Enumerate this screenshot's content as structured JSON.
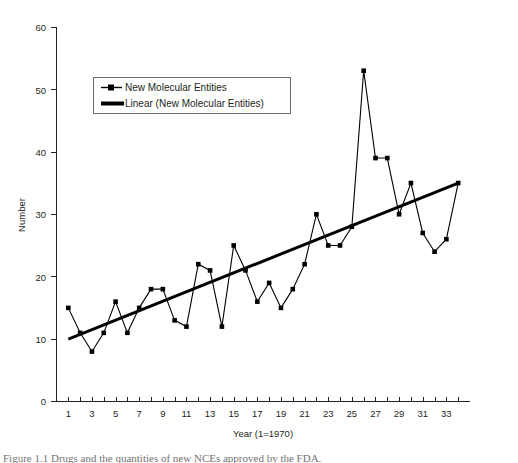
{
  "figure": {
    "caption_partial": "Figure 1.1  Drugs and the quantities of new NCEs approved by the FDA."
  },
  "legend": {
    "position": "top-left-inside",
    "entries": [
      {
        "label": "New Molecular Entities",
        "marker": "square-line",
        "color": "#000000"
      },
      {
        "label": "Linear (New Molecular Entities)",
        "marker": "thick-line",
        "color": "#000000"
      }
    ]
  },
  "chart_data": {
    "type": "line",
    "title": "",
    "xlabel": "Year (1=1970)",
    "ylabel": "Number",
    "xlim": [
      0,
      35
    ],
    "ylim": [
      0,
      60
    ],
    "yticks": [
      0,
      10,
      20,
      30,
      40,
      50,
      60
    ],
    "xticks": [
      1,
      2,
      3,
      4,
      5,
      6,
      7,
      8,
      9,
      10,
      11,
      12,
      13,
      14,
      15,
      16,
      17,
      18,
      19,
      20,
      21,
      22,
      23,
      24,
      25,
      26,
      27,
      28,
      29,
      30,
      31,
      32,
      33,
      34
    ],
    "xtick_labels_shown": [
      1,
      3,
      5,
      7,
      9,
      11,
      13,
      15,
      17,
      19,
      21,
      23,
      25,
      27,
      29,
      31,
      33
    ],
    "grid": false,
    "x": [
      1,
      2,
      3,
      4,
      5,
      6,
      7,
      8,
      9,
      10,
      11,
      12,
      13,
      14,
      15,
      16,
      17,
      18,
      19,
      20,
      21,
      22,
      23,
      24,
      25,
      26,
      27,
      28,
      29,
      30,
      31,
      32,
      33,
      34
    ],
    "series": [
      {
        "name": "New Molecular Entities",
        "values": [
          15,
          11,
          8,
          11,
          16,
          11,
          15,
          18,
          18,
          13,
          12,
          22,
          21,
          12,
          25,
          21,
          16,
          19,
          15,
          18,
          22,
          30,
          25,
          25,
          28,
          53,
          39,
          39,
          30,
          35,
          27,
          24,
          26,
          35
        ]
      },
      {
        "name": "Linear (New Molecular Entities)",
        "type": "trendline",
        "endpoints": [
          {
            "x": 1,
            "y": 10
          },
          {
            "x": 34,
            "y": 35
          }
        ]
      }
    ]
  }
}
